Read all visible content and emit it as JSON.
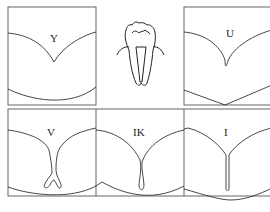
{
  "figure": {
    "panels": [
      {
        "id": "Y",
        "label": "Y"
      },
      {
        "id": "U",
        "label": "U"
      },
      {
        "id": "V",
        "label": "V"
      },
      {
        "id": "IK",
        "label": "IK"
      },
      {
        "id": "I",
        "label": "I"
      }
    ],
    "center_icon": "tooth-cross-section-icon",
    "colors": {
      "line": "#333333",
      "border": "#555555",
      "background": "#ffffff"
    }
  }
}
